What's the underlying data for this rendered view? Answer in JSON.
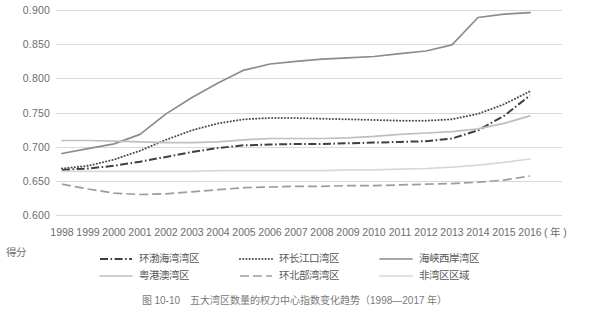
{
  "figure": {
    "caption": "图 10-10　五大湾区数量的权力中心指数变化趋势（1998—2017 年）",
    "y_axis_title": "得分",
    "x_axis_unit": "( 年 )"
  },
  "chart_data": {
    "type": "line",
    "title": "五大湾区数量的权力中心指数变化趋势（1998—2017 年）",
    "xlabel": "年",
    "ylabel": "得分",
    "ylim": [
      0.6,
      0.9
    ],
    "yticks": [
      "0.600",
      "0.650",
      "0.700",
      "0.750",
      "0.800",
      "0.850",
      "0.900"
    ],
    "ytick_values": [
      0.6,
      0.65,
      0.7,
      0.75,
      0.8,
      0.85,
      0.9
    ],
    "grid": true,
    "legend_position": "bottom",
    "categories": [
      "1998",
      "1999",
      "2000",
      "2001",
      "2002",
      "2003",
      "2004",
      "2005",
      "2006",
      "2007",
      "2008",
      "2009",
      "2010",
      "2011",
      "2012",
      "2013",
      "2014",
      "2015",
      "2016"
    ],
    "series": [
      {
        "name": "环渤海湾湾区",
        "style": "dash-dot",
        "color": "#3f3f3f",
        "values": [
          0.666,
          0.668,
          0.672,
          0.678,
          0.685,
          0.692,
          0.698,
          0.702,
          0.703,
          0.704,
          0.704,
          0.705,
          0.706,
          0.707,
          0.708,
          0.712,
          0.724,
          0.745,
          0.775
        ]
      },
      {
        "name": "环长江口湾区",
        "style": "dotted",
        "color": "#4d4d4d",
        "values": [
          0.668,
          0.672,
          0.681,
          0.694,
          0.71,
          0.724,
          0.734,
          0.74,
          0.742,
          0.742,
          0.741,
          0.74,
          0.739,
          0.738,
          0.738,
          0.74,
          0.748,
          0.762,
          0.781
        ]
      },
      {
        "name": "海峡西岸湾区",
        "style": "solid",
        "color": "#8c8c8c",
        "values": [
          0.69,
          0.697,
          0.704,
          0.718,
          0.748,
          0.772,
          0.793,
          0.812,
          0.821,
          0.825,
          0.828,
          0.83,
          0.832,
          0.836,
          0.84,
          0.849,
          0.889,
          0.894,
          0.896
        ]
      },
      {
        "name": "粤港澳湾区",
        "style": "solid-light",
        "color": "#bfbfbf",
        "values": [
          0.709,
          0.709,
          0.708,
          0.707,
          0.706,
          0.706,
          0.707,
          0.71,
          0.712,
          0.712,
          0.712,
          0.713,
          0.715,
          0.718,
          0.72,
          0.722,
          0.726,
          0.734,
          0.745
        ]
      },
      {
        "name": "环北部湾湾区",
        "style": "dashed",
        "color": "#9c9c9c",
        "values": [
          0.645,
          0.638,
          0.632,
          0.63,
          0.631,
          0.634,
          0.637,
          0.64,
          0.641,
          0.642,
          0.642,
          0.643,
          0.643,
          0.644,
          0.645,
          0.646,
          0.648,
          0.651,
          0.657
        ]
      },
      {
        "name": "非湾区区域",
        "style": "solid-lightest",
        "color": "#d8d8d8",
        "values": [
          0.664,
          0.664,
          0.664,
          0.664,
          0.664,
          0.664,
          0.665,
          0.665,
          0.665,
          0.665,
          0.665,
          0.666,
          0.666,
          0.667,
          0.668,
          0.67,
          0.673,
          0.677,
          0.682
        ]
      }
    ]
  },
  "legend": {
    "items": [
      {
        "label": "环渤海湾湾区",
        "style": "dash-dot",
        "color": "#3f3f3f"
      },
      {
        "label": "环长江口湾区",
        "style": "dotted",
        "color": "#4d4d4d"
      },
      {
        "label": "海峡西岸湾区",
        "style": "solid",
        "color": "#8c8c8c"
      },
      {
        "label": "粤港澳湾区",
        "style": "solid-light",
        "color": "#bfbfbf"
      },
      {
        "label": "环北部湾湾区",
        "style": "dashed",
        "color": "#9c9c9c"
      },
      {
        "label": "非湾区区域",
        "style": "solid-lightest",
        "color": "#d8d8d8"
      }
    ]
  }
}
